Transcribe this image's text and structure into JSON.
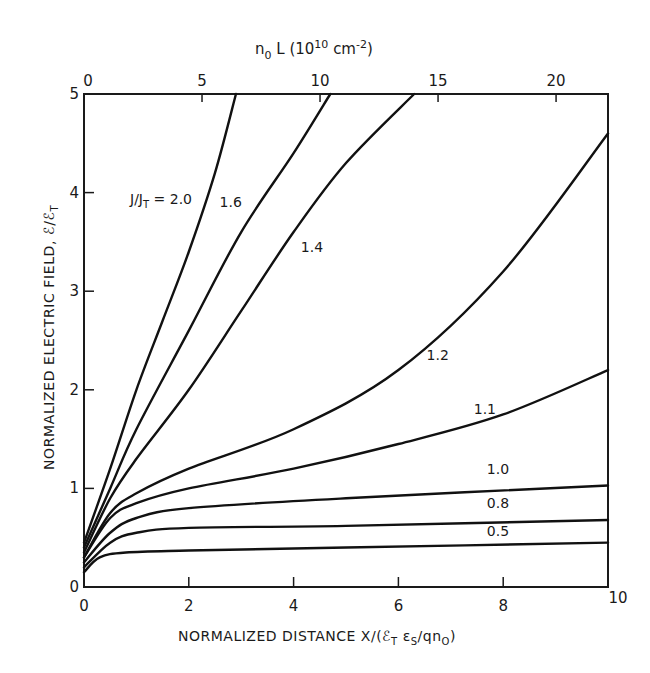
{
  "chart_data": {
    "type": "line",
    "title": "",
    "xlabel": "NORMALIZED DISTANCE  X/(ℰT εS/qn0)",
    "ylabel": "NORMALIZED ELECTRIC FIELD, ℰ/ℰT",
    "top_xlabel": "n0 L (10^10 cm^-2)",
    "xlim": [
      0,
      10
    ],
    "ylim": [
      0,
      5
    ],
    "top_xlim": [
      0,
      22.2
    ],
    "x_ticks": [
      0,
      2,
      4,
      6,
      8,
      10
    ],
    "y_ticks": [
      0,
      1,
      2,
      3,
      4,
      5
    ],
    "top_x_ticks": [
      0,
      5,
      10,
      15,
      20
    ],
    "grid": false,
    "legend": "inline curve labels",
    "parameter_label": "J/JT",
    "series": [
      {
        "name": "0.5",
        "label": "0.5",
        "x": [
          0,
          0.3,
          0.8,
          2,
          5,
          10
        ],
        "y": [
          0.15,
          0.3,
          0.35,
          0.37,
          0.4,
          0.45
        ]
      },
      {
        "name": "0.8",
        "label": "0.8",
        "x": [
          0,
          0.5,
          1,
          2,
          5,
          10
        ],
        "y": [
          0.2,
          0.45,
          0.55,
          0.6,
          0.62,
          0.68
        ]
      },
      {
        "name": "1.0",
        "label": "1.0",
        "x": [
          0,
          0.5,
          1,
          2,
          5,
          10
        ],
        "y": [
          0.25,
          0.55,
          0.7,
          0.8,
          0.9,
          1.03
        ]
      },
      {
        "name": "1.1",
        "label": "1.1",
        "x": [
          0,
          0.5,
          1,
          2,
          4,
          6,
          8,
          10
        ],
        "y": [
          0.3,
          0.7,
          0.85,
          1.0,
          1.2,
          1.45,
          1.75,
          2.2
        ]
      },
      {
        "name": "1.2",
        "label": "1.2",
        "x": [
          0,
          0.5,
          1,
          2,
          4,
          6,
          8,
          10
        ],
        "y": [
          0.3,
          0.75,
          0.95,
          1.2,
          1.6,
          2.2,
          3.2,
          4.6
        ]
      },
      {
        "name": "1.4",
        "label": "1.4",
        "x": [
          0,
          0.5,
          1,
          2,
          3,
          4,
          5,
          6.3
        ],
        "y": [
          0.35,
          0.9,
          1.3,
          2.0,
          2.8,
          3.6,
          4.3,
          5.0
        ]
      },
      {
        "name": "1.6",
        "label": "1.6",
        "x": [
          0,
          0.5,
          1,
          2,
          3,
          4,
          4.7
        ],
        "y": [
          0.4,
          1.0,
          1.6,
          2.6,
          3.6,
          4.4,
          5.0
        ]
      },
      {
        "name": "2.0",
        "label": "J/JT = 2.0",
        "x": [
          0,
          0.5,
          1,
          1.5,
          2,
          2.5,
          2.9
        ],
        "y": [
          0.45,
          1.2,
          2.0,
          2.7,
          3.4,
          4.2,
          5.0
        ]
      }
    ],
    "annotations": [
      {
        "text": "J/JT = 2.0",
        "x": 1.3,
        "y": 4.0
      },
      {
        "text": "1.6",
        "x": 2.8,
        "y": 3.85
      },
      {
        "text": "1.4",
        "x": 4.35,
        "y": 3.4
      },
      {
        "text": "1.2",
        "x": 6.75,
        "y": 2.3
      },
      {
        "text": "1.1",
        "x": 7.65,
        "y": 1.75
      },
      {
        "text": "1.0",
        "x": 7.9,
        "y": 1.15
      },
      {
        "text": "0.8",
        "x": 7.9,
        "y": 0.8
      },
      {
        "text": "0.5",
        "x": 7.9,
        "y": 0.52
      }
    ]
  },
  "labels": {
    "top_axis_title": "n",
    "top_axis_sub": "0",
    "top_axis_rest": " L (10",
    "top_axis_sup": "10",
    "top_axis_unit": "  cm",
    "top_axis_unit_sup": "-2",
    "top_axis_close": ")",
    "y_axis_title": "NORMALIZED ELECTRIC FIELD, ℰ/ℰ",
    "y_axis_sub": "T",
    "x_axis_title_a": "NORMALIZED DISTANCE  X/(ℰ",
    "x_axis_sub1": "T",
    "x_axis_mid": " ε",
    "x_axis_sub2": "S",
    "x_axis_mid2": "/qn",
    "x_axis_sub3": "O",
    "x_axis_close": ")",
    "param_prefix": "J/J",
    "param_sub": "T",
    "param_val": " = 2.0"
  }
}
